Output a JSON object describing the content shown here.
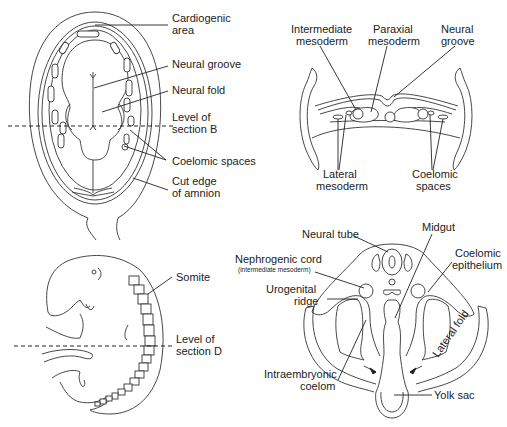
{
  "figure": {
    "panel_a": {
      "name": "dorsal view of embryo with amnion cut",
      "labels": {
        "cardiogenic_1": "Cardiogenic",
        "cardiogenic_2": "area",
        "neural_groove": "Neural groove",
        "neural_fold": "Neural fold",
        "level_b_1": "Level of",
        "level_b_2": "section B",
        "coelomic_spaces": "Coelomic spaces",
        "cut_edge_1": "Cut edge",
        "cut_edge_2": "of amnion"
      }
    },
    "panel_b": {
      "name": "transverse section B",
      "labels": {
        "intermediate_1": "Intermediate",
        "intermediate_2": "mesoderm",
        "paraxial_1": "Paraxial",
        "paraxial_2": "mesoderm",
        "neural_groove_1": "Neural",
        "neural_groove_2": "groove",
        "lateral_1": "Lateral",
        "lateral_2": "mesoderm",
        "coelomic_1": "Coelomic",
        "coelomic_2": "spaces"
      }
    },
    "panel_c": {
      "name": "lateral view of embryo with somites",
      "labels": {
        "somite": "Somite",
        "level_d_1": "Level of",
        "level_d_2": "section D"
      }
    },
    "panel_d": {
      "name": "transverse section D",
      "labels": {
        "neural_tube": "Neural tube",
        "midgut": "Midgut",
        "nephrogenic_1": "Nephrogenic cord",
        "nephrogenic_2": "(intermediate mesoderm)",
        "coelomic_epi_1": "Coelomic",
        "coelomic_epi_2": "epithelium",
        "urogenital_1": "Urogenital",
        "urogenital_2": "ridge",
        "lateral_fold": "Lateral fold",
        "intraembryonic_1": "Intraembryonic",
        "intraembryonic_2": "coelom",
        "yolk_sac": "Yolk sac"
      }
    }
  }
}
